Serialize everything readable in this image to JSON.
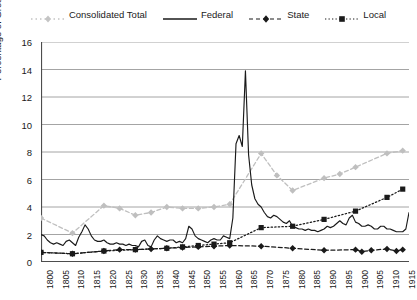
{
  "legend": {
    "position": "top",
    "entries": [
      {
        "label": "Consolidated Total",
        "style": "dashed-marker",
        "color": "#bfbfbf",
        "marker": "diamond"
      },
      {
        "label": "Federal",
        "style": "solid",
        "color": "#1a1a1a",
        "marker": "none"
      },
      {
        "label": "State",
        "style": "dashed-marker",
        "color": "#1a1a1a",
        "marker": "diamond"
      },
      {
        "label": "Local",
        "style": "dotted-marker",
        "color": "#1a1a1a",
        "marker": "square"
      }
    ]
  },
  "axes": {
    "ylabel": "Percentage of Gross Domestic Product",
    "xlabel": "",
    "ylim": [
      0,
      16
    ],
    "ytick_step": 2,
    "yticks": [
      "0",
      "2",
      "4",
      "6",
      "8",
      "10",
      "12",
      "14",
      "16"
    ],
    "xlim": [
      1800,
      1917
    ],
    "xtick_step": 5,
    "xticks": [
      "1800",
      "1805",
      "1810",
      "1815",
      "1820",
      "1825",
      "1830",
      "1835",
      "1840",
      "1845",
      "1850",
      "1855",
      "1860",
      "1865",
      "1870",
      "1875",
      "1880",
      "1885",
      "1890",
      "1895",
      "1900",
      "1905",
      "1910",
      "1915"
    ],
    "grid": "horizontal"
  },
  "chart_data": {
    "type": "line",
    "title": "",
    "xlabel": "",
    "ylabel": "Percentage of Gross Domestic Product",
    "xlim": [
      1800,
      1917
    ],
    "ylim": [
      0,
      16
    ],
    "grid": true,
    "legend_position": "top",
    "series": [
      {
        "name": "Consolidated Total",
        "color": "#bfbfbf",
        "style": "dashed",
        "marker": "diamond",
        "x": [
          1800,
          1810,
          1820,
          1825,
          1830,
          1835,
          1840,
          1845,
          1850,
          1855,
          1860,
          1870,
          1875,
          1880,
          1890,
          1895,
          1900,
          1910,
          1915
        ],
        "y": [
          3.2,
          2.1,
          4.1,
          3.9,
          3.4,
          3.6,
          4.0,
          3.9,
          3.9,
          4.0,
          4.2,
          7.9,
          6.3,
          5.2,
          6.1,
          6.4,
          6.9,
          7.9,
          8.1
        ]
      },
      {
        "name": "Federal",
        "color": "#1a1a1a",
        "style": "solid",
        "marker": "none",
        "x": [
          1800,
          1801,
          1802,
          1803,
          1804,
          1805,
          1806,
          1807,
          1808,
          1809,
          1810,
          1811,
          1812,
          1813,
          1814,
          1815,
          1816,
          1817,
          1818,
          1819,
          1820,
          1821,
          1822,
          1823,
          1824,
          1825,
          1826,
          1827,
          1828,
          1829,
          1830,
          1831,
          1832,
          1833,
          1834,
          1835,
          1836,
          1837,
          1838,
          1839,
          1840,
          1841,
          1842,
          1843,
          1844,
          1845,
          1846,
          1847,
          1848,
          1849,
          1850,
          1851,
          1852,
          1853,
          1854,
          1855,
          1856,
          1857,
          1858,
          1859,
          1860,
          1861,
          1862,
          1863,
          1864,
          1865,
          1866,
          1867,
          1868,
          1869,
          1870,
          1871,
          1872,
          1873,
          1874,
          1875,
          1876,
          1877,
          1878,
          1879,
          1880,
          1881,
          1882,
          1883,
          1884,
          1885,
          1886,
          1887,
          1888,
          1889,
          1890,
          1891,
          1892,
          1893,
          1894,
          1895,
          1896,
          1897,
          1898,
          1899,
          1900,
          1901,
          1902,
          1903,
          1904,
          1905,
          1906,
          1907,
          1908,
          1909,
          1910,
          1911,
          1912,
          1913,
          1914,
          1915,
          1916,
          1917
        ],
        "y": [
          2.0,
          1.9,
          1.6,
          1.4,
          1.3,
          1.4,
          1.3,
          1.2,
          1.5,
          1.6,
          1.4,
          1.2,
          1.8,
          2.2,
          2.7,
          2.4,
          1.9,
          1.6,
          1.5,
          1.5,
          1.6,
          1.4,
          1.3,
          1.3,
          1.4,
          1.3,
          1.3,
          1.2,
          1.3,
          1.2,
          1.2,
          1.1,
          1.5,
          1.6,
          1.2,
          1.1,
          1.6,
          1.9,
          1.7,
          1.6,
          1.5,
          1.6,
          1.6,
          1.4,
          1.5,
          1.4,
          1.7,
          2.6,
          2.4,
          1.9,
          1.7,
          1.6,
          1.5,
          1.4,
          1.6,
          1.7,
          1.6,
          1.6,
          1.9,
          1.8,
          1.7,
          3.2,
          8.6,
          9.2,
          8.4,
          13.9,
          7.8,
          5.6,
          4.6,
          4.2,
          4.0,
          3.6,
          3.3,
          3.2,
          3.4,
          3.3,
          3.1,
          2.9,
          2.8,
          3.0,
          2.6,
          2.5,
          2.4,
          2.4,
          2.3,
          2.4,
          2.3,
          2.3,
          2.2,
          2.3,
          2.4,
          2.6,
          2.5,
          2.6,
          2.8,
          3.0,
          2.8,
          2.7,
          3.2,
          3.4,
          2.9,
          2.8,
          2.6,
          2.6,
          2.7,
          2.6,
          2.4,
          2.4,
          2.6,
          2.6,
          2.4,
          2.4,
          2.3,
          2.2,
          2.2,
          2.2,
          2.4,
          3.6
        ]
      },
      {
        "name": "State",
        "color": "#1a1a1a",
        "style": "dashed",
        "marker": "diamond",
        "x": [
          1800,
          1810,
          1820,
          1825,
          1830,
          1835,
          1840,
          1845,
          1850,
          1855,
          1860,
          1870,
          1880,
          1890,
          1900,
          1902,
          1905,
          1910,
          1913,
          1915
        ],
        "y": [
          0.7,
          0.6,
          0.8,
          0.9,
          0.9,
          0.95,
          1.0,
          1.05,
          1.1,
          1.15,
          1.2,
          1.15,
          1.0,
          0.85,
          0.9,
          0.75,
          0.85,
          0.95,
          0.8,
          0.9
        ]
      },
      {
        "name": "Local",
        "color": "#1a1a1a",
        "style": "dotted",
        "marker": "square",
        "x": [
          1800,
          1810,
          1820,
          1830,
          1840,
          1845,
          1850,
          1855,
          1860,
          1870,
          1880,
          1890,
          1900,
          1910,
          1915
        ],
        "y": [
          0.7,
          0.6,
          0.8,
          0.9,
          1.0,
          1.1,
          1.2,
          1.3,
          1.4,
          2.5,
          2.6,
          3.1,
          3.7,
          4.7,
          5.3
        ]
      }
    ]
  }
}
